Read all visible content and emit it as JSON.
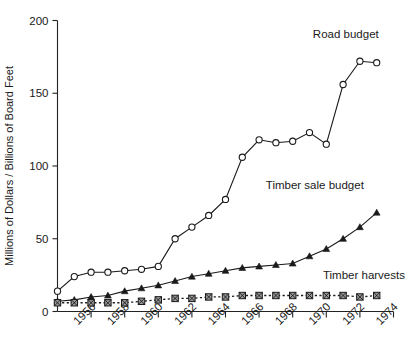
{
  "chart_data": {
    "type": "line",
    "title": "",
    "xlabel": "",
    "ylabel": "Millions of Dollars / Billions of Board Feet",
    "xlim": [
      1954,
      1974
    ],
    "ylim": [
      0,
      200
    ],
    "yticks": [
      0,
      50,
      100,
      150,
      200
    ],
    "ytick_labels": [
      "0",
      "50",
      "100",
      "150",
      "200"
    ],
    "xticks": [
      1956,
      1958,
      1960,
      1962,
      1964,
      1966,
      1968,
      1970,
      1972,
      1974
    ],
    "xtick_labels": [
      "1956",
      "1958",
      "1960",
      "1962",
      "1964",
      "1966",
      "1968",
      "1970",
      "1972",
      "1974"
    ],
    "grid": false,
    "legend_position": "inline-annotations",
    "x": [
      1954,
      1955,
      1956,
      1957,
      1958,
      1959,
      1960,
      1961,
      1962,
      1963,
      1964,
      1965,
      1966,
      1967,
      1968,
      1969,
      1970,
      1971,
      1972,
      1973
    ],
    "series": [
      {
        "name": "Road budget",
        "marker": "open-circle",
        "line_style": "solid",
        "label_x": 1969.2,
        "label_y": 188,
        "values": [
          14,
          24,
          27,
          27,
          28,
          29,
          31,
          50,
          58,
          66,
          77,
          106,
          118,
          116,
          117,
          123,
          115,
          156,
          172,
          171
        ]
      },
      {
        "name": "Timber sale budget",
        "marker": "filled-triangle",
        "line_style": "solid",
        "label_x": 1966.4,
        "label_y": 84,
        "values": [
          7,
          8,
          10,
          11,
          14,
          16,
          18,
          21,
          24,
          26,
          28,
          30,
          31,
          32,
          33,
          38,
          43,
          50,
          58,
          68
        ]
      },
      {
        "name": "Timber harvests",
        "marker": "crossed-square",
        "line_style": "dotted",
        "label_x": 1969.8,
        "label_y": 22,
        "values": [
          6,
          6,
          6,
          6,
          6,
          7,
          8,
          9,
          9,
          10,
          10,
          11,
          11,
          11,
          11,
          11,
          11,
          11,
          10,
          11
        ]
      }
    ]
  },
  "footer": {
    "caption": ""
  }
}
